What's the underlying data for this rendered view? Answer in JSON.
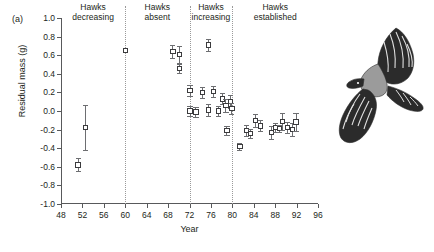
{
  "figure": {
    "panel_label": "(a)",
    "illustration": "hawk-in-flight-illustration"
  },
  "chart_data": {
    "type": "scatter",
    "title": "",
    "xlabel": "Year",
    "ylabel": "Residual mass (g)",
    "xlim": [
      48,
      96
    ],
    "ylim": [
      -1.0,
      1.0
    ],
    "grid": false,
    "legend": "none",
    "error_bars": "vertical, with caps",
    "marker": "open square",
    "xticks": [
      48,
      52,
      56,
      60,
      64,
      68,
      72,
      76,
      80,
      84,
      88,
      92,
      96
    ],
    "xtick_labels": [
      "48",
      "52",
      "56",
      "60",
      "64",
      "68",
      "72",
      "76",
      "80",
      "84",
      "88",
      "92",
      "96"
    ],
    "yticks": [
      1.0,
      0.8,
      0.6,
      0.4,
      0.2,
      0.0,
      -0.2,
      -0.4,
      -0.6,
      -0.8,
      -1.0
    ],
    "ytick_labels": [
      "1.0",
      "0.8",
      "0.6",
      "0.4",
      "0.2",
      "0.0",
      "-0.2",
      "-0.4",
      "-0.6",
      "-0.8",
      "-1.0"
    ],
    "regions": [
      {
        "label": "Hawks\ndecreasing",
        "start": 48,
        "end": 60,
        "center": 54
      },
      {
        "label": "Hawks\nabsent",
        "start": 60,
        "end": 72,
        "center": 66
      },
      {
        "label": "Hawks\nincreasing",
        "start": 72,
        "end": 80,
        "center": 76
      },
      {
        "label": "Hawks\nestablished",
        "start": 80,
        "end": 96,
        "center": 88
      }
    ],
    "dividers": [
      60,
      72,
      80
    ],
    "points": [
      {
        "x": 51.2,
        "y": -0.58,
        "err_low": 0.07,
        "err_high": 0.07
      },
      {
        "x": 52.6,
        "y": -0.18,
        "err_low": 0.24,
        "err_high": 0.24
      },
      {
        "x": 60.0,
        "y": 0.65,
        "err_low": 0.0,
        "err_high": 0.0
      },
      {
        "x": 68.9,
        "y": 0.64,
        "err_low": 0.07,
        "err_high": 0.07
      },
      {
        "x": 70.1,
        "y": 0.61,
        "err_low": 0.09,
        "err_high": 0.09
      },
      {
        "x": 70.1,
        "y": 0.46,
        "err_low": 0.05,
        "err_high": 0.05
      },
      {
        "x": 72.1,
        "y": 0.22,
        "err_low": 0.06,
        "err_high": 0.06
      },
      {
        "x": 72.1,
        "y": 0.0,
        "err_low": 0.05,
        "err_high": 0.05
      },
      {
        "x": 73.2,
        "y": -0.01,
        "err_low": 0.05,
        "err_high": 0.05
      },
      {
        "x": 74.4,
        "y": 0.2,
        "err_low": 0.06,
        "err_high": 0.06
      },
      {
        "x": 75.5,
        "y": 0.01,
        "err_low": 0.06,
        "err_high": 0.06
      },
      {
        "x": 75.6,
        "y": 0.71,
        "err_low": 0.06,
        "err_high": 0.06
      },
      {
        "x": 76.5,
        "y": 0.21,
        "err_low": 0.06,
        "err_high": 0.06
      },
      {
        "x": 77.4,
        "y": 0.0,
        "err_low": 0.05,
        "err_high": 0.05
      },
      {
        "x": 78.2,
        "y": 0.13,
        "err_low": 0.06,
        "err_high": 0.06
      },
      {
        "x": 78.8,
        "y": 0.06,
        "err_low": 0.07,
        "err_high": 0.07
      },
      {
        "x": 79.0,
        "y": -0.21,
        "err_low": 0.05,
        "err_high": 0.05
      },
      {
        "x": 79.6,
        "y": 0.1,
        "err_low": 0.07,
        "err_high": 0.07
      },
      {
        "x": 79.9,
        "y": 0.03,
        "err_low": 0.06,
        "err_high": 0.06
      },
      {
        "x": 81.4,
        "y": -0.38,
        "err_low": 0.04,
        "err_high": 0.04
      },
      {
        "x": 82.6,
        "y": -0.21,
        "err_low": 0.06,
        "err_high": 0.06
      },
      {
        "x": 83.4,
        "y": -0.24,
        "err_low": 0.05,
        "err_high": 0.05
      },
      {
        "x": 84.3,
        "y": -0.1,
        "err_low": 0.07,
        "err_high": 0.07
      },
      {
        "x": 85.3,
        "y": -0.16,
        "err_low": 0.06,
        "err_high": 0.06
      },
      {
        "x": 87.3,
        "y": -0.23,
        "err_low": 0.07,
        "err_high": 0.07
      },
      {
        "x": 88.1,
        "y": -0.18,
        "err_low": 0.05,
        "err_high": 0.05
      },
      {
        "x": 88.8,
        "y": -0.19,
        "err_low": 0.04,
        "err_high": 0.04
      },
      {
        "x": 89.4,
        "y": -0.11,
        "err_low": 0.09,
        "err_high": 0.09
      },
      {
        "x": 90.3,
        "y": -0.18,
        "err_low": 0.06,
        "err_high": 0.06
      },
      {
        "x": 91.2,
        "y": -0.2,
        "err_low": 0.07,
        "err_high": 0.07
      },
      {
        "x": 91.9,
        "y": -0.12,
        "err_low": 0.1,
        "err_high": 0.1
      }
    ]
  }
}
